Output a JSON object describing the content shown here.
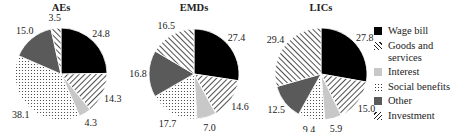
{
  "chart_data": [
    {
      "type": "pie",
      "title": "AEs",
      "categories": [
        "Wage bill",
        "Goods and services",
        "Interest",
        "Social benefits",
        "Other",
        "Investment"
      ],
      "values": [
        24.8,
        14.3,
        4.3,
        38.1,
        15.0,
        3.5
      ]
    },
    {
      "type": "pie",
      "title": "EMDs",
      "categories": [
        "Wage bill",
        "Goods and services",
        "Interest",
        "Social benefits",
        "Other",
        "Investment"
      ],
      "values": [
        27.4,
        14.6,
        7.0,
        17.7,
        16.8,
        16.5
      ]
    },
    {
      "type": "pie",
      "title": "LICs",
      "categories": [
        "Wage bill",
        "Goods and services",
        "Interest",
        "Social benefits",
        "Other",
        "Investment"
      ],
      "values": [
        27.8,
        15.0,
        5.9,
        9.4,
        12.5,
        29.4
      ]
    }
  ],
  "legend": {
    "position": "right",
    "items": [
      {
        "label": "Wage bill",
        "pattern": "solid-black"
      },
      {
        "label": "Goods and services",
        "pattern": "diagonal-hatch-backslash"
      },
      {
        "label": "Interest",
        "pattern": "light-gray"
      },
      {
        "label": "Social benefits",
        "pattern": "dots"
      },
      {
        "label": "Other",
        "pattern": "dark-gray"
      },
      {
        "label": "Investment",
        "pattern": "diagonal-hatch-slash"
      }
    ]
  },
  "colors": {
    "wage_bill": "#000000",
    "interest": "#c8c8c8",
    "other": "#5a5a5a",
    "hatch": "#222222"
  }
}
